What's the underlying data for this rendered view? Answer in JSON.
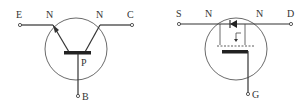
{
  "diagram": {
    "bjt": {
      "type": "NPN bipolar transistor",
      "labels": {
        "emitter": "E",
        "collector": "C",
        "base": "B",
        "emitter_region": "N",
        "collector_region": "N",
        "base_region": "P"
      }
    },
    "mosfet": {
      "type": "N-channel MOSFET",
      "labels": {
        "source": "S",
        "drain": "D",
        "gate": "G",
        "source_region": "N",
        "drain_region": "N"
      }
    }
  }
}
